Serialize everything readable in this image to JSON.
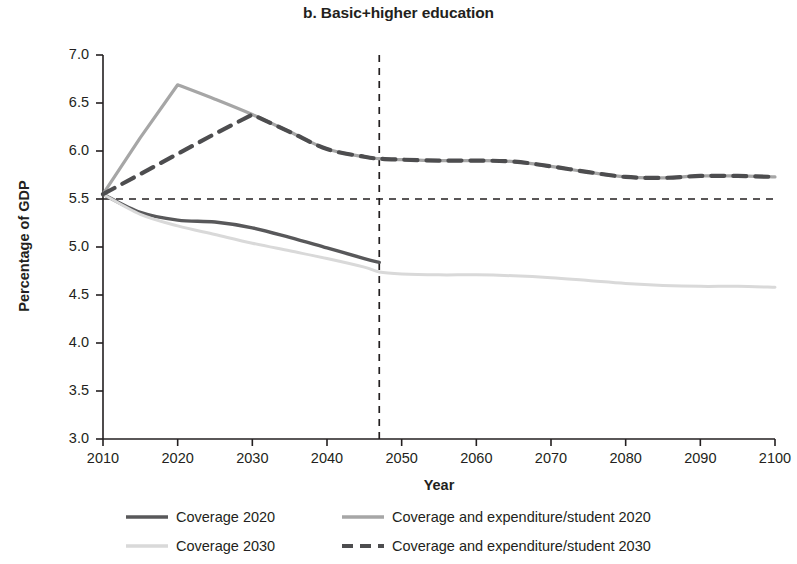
{
  "chart_data": {
    "type": "line",
    "title": "b. Basic+higher education",
    "xlabel": "Year",
    "ylabel": "Percentage of GDP",
    "xlim": [
      2010,
      2100
    ],
    "ylim": [
      3.0,
      7.0
    ],
    "grid": false,
    "legend_position": "bottom",
    "xticks": [
      "2010",
      "2020",
      "2030",
      "2040",
      "2050",
      "2060",
      "2070",
      "2080",
      "2090",
      "2100"
    ],
    "yticks": [
      "3.0",
      "3.5",
      "4.0",
      "4.5",
      "5.0",
      "5.5",
      "6.0",
      "6.5",
      "7.0"
    ],
    "x": [
      2010,
      2015,
      2020,
      2025,
      2030,
      2035,
      2040,
      2045,
      2047,
      2050,
      2055,
      2060,
      2065,
      2070,
      2075,
      2080,
      2085,
      2090,
      2095,
      2100
    ],
    "series": [
      {
        "name": "Coverage 2020",
        "color": "#58585a",
        "style": "solid",
        "width": 3.4,
        "values": [
          5.55,
          5.36,
          5.28,
          5.26,
          5.2,
          5.1,
          4.99,
          4.88,
          4.84,
          null,
          null,
          null,
          null,
          null,
          null,
          null,
          null,
          null,
          null,
          null
        ]
      },
      {
        "name": "Coverage 2030",
        "color": "#d9d9d9",
        "style": "solid",
        "width": 3.0,
        "values": [
          5.55,
          5.34,
          5.22,
          5.13,
          5.04,
          4.96,
          4.88,
          4.79,
          4.74,
          4.72,
          4.71,
          4.71,
          4.7,
          4.68,
          4.65,
          4.62,
          4.6,
          4.59,
          4.59,
          4.58
        ]
      },
      {
        "name": "Coverage and expenditure/student 2020",
        "color": "#a6a6a6",
        "style": "solid",
        "width": 3.2,
        "values": [
          5.55,
          6.14,
          6.69,
          6.54,
          6.38,
          6.2,
          6.02,
          5.94,
          5.92,
          5.91,
          5.9,
          5.9,
          5.89,
          5.84,
          5.78,
          5.73,
          5.72,
          5.74,
          5.74,
          5.73
        ]
      },
      {
        "name": "Coverage and expenditure/student 2030",
        "color": "#4d4d4f",
        "style": "dashed",
        "width": 4.2,
        "values": [
          5.55,
          5.76,
          5.97,
          6.18,
          6.38,
          6.2,
          6.02,
          5.94,
          5.92,
          5.91,
          5.9,
          5.9,
          5.89,
          5.84,
          5.78,
          5.73,
          5.72,
          5.74,
          5.74,
          5.73
        ]
      }
    ],
    "reference_lines": [
      {
        "name": "baseline-5-5",
        "orientation": "horizontal",
        "value": 5.5,
        "style": "dashed",
        "color": "#231f20"
      },
      {
        "name": "year-2047",
        "orientation": "vertical",
        "value": 2047,
        "style": "dashed",
        "color": "#231f20"
      }
    ]
  },
  "legend": {
    "items": [
      {
        "label": "Coverage 2020",
        "color": "#58585a",
        "style": "solid"
      },
      {
        "label": "Coverage and expenditure/student 2020",
        "color": "#a6a6a6",
        "style": "solid"
      },
      {
        "label": "Coverage 2030",
        "color": "#d9d9d9",
        "style": "solid"
      },
      {
        "label": "Coverage and expenditure/student 2030",
        "color": "#4d4d4f",
        "style": "dashed"
      }
    ]
  }
}
